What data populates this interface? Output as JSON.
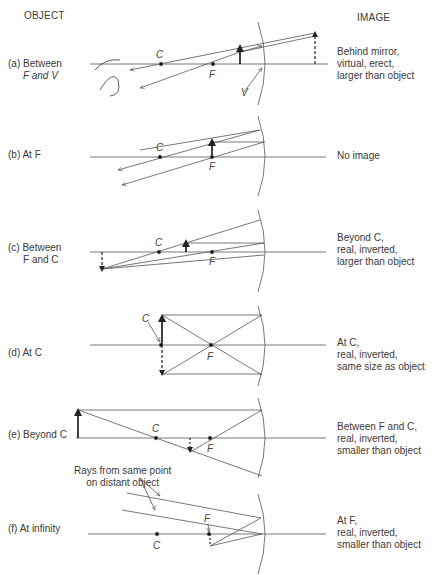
{
  "headers": {
    "object": "OBJECT",
    "image": "IMAGE"
  },
  "cases": [
    {
      "id": "a",
      "object_line1": "(a) Between",
      "object_line2": "F and V",
      "image_lines": [
        "Behind mirror,",
        "virtual, erect,",
        "larger than object"
      ]
    },
    {
      "id": "b",
      "object_line1": "(b) At F",
      "object_line2": "",
      "image_lines": [
        "No image"
      ]
    },
    {
      "id": "c",
      "object_line1": "(c) Between",
      "object_line2": "F and C",
      "image_lines": [
        "Beyond C,",
        "real, inverted,",
        "larger than object"
      ]
    },
    {
      "id": "d",
      "object_line1": "(d) At C",
      "object_line2": "",
      "image_lines": [
        "At C,",
        "real, inverted,",
        "same size as object"
      ]
    },
    {
      "id": "e",
      "object_line1": "(e) Beyond C",
      "object_line2": "",
      "image_lines": [
        "Between F and C,",
        "real, inverted,",
        "smaller than object"
      ]
    },
    {
      "id": "f",
      "object_line1": "(f) At infinity",
      "object_line2": "",
      "image_lines": [
        "At F,",
        "real, inverted,",
        "smaller than object"
      ]
    }
  ],
  "point_labels": {
    "C": "C",
    "F": "F",
    "V": "V"
  },
  "annotation": {
    "line1": "Rays from same point",
    "line2": "on distant object"
  }
}
